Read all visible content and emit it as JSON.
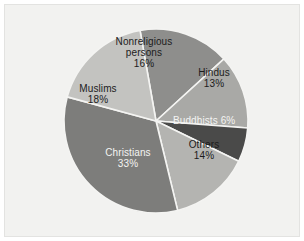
{
  "chart_data": {
    "type": "pie",
    "title": "",
    "subtitle": "",
    "xlabel": "",
    "ylabel": "",
    "legend_position": "none",
    "labels_position": "inside-slices",
    "grid": false,
    "total_percent": 100,
    "categories": [
      "Nonreligious persons",
      "Hindus",
      "Buddhists",
      "Others",
      "Christians",
      "Muslims"
    ],
    "values": [
      16,
      13,
      6,
      14,
      33,
      18
    ],
    "unit": "%",
    "slices": [
      {
        "name": "Nonreligious persons",
        "label_text": "Nonreligious\npersons\n16%",
        "value": 16,
        "value_text": "16%",
        "color": "#8e8e8c",
        "text_color": "#1c1c1c",
        "start_angle": -100,
        "sweep_angle": 57.6
      },
      {
        "name": "Hindus",
        "label_text": "Hindus\n13%",
        "value": 13,
        "value_text": "13%",
        "color": "#a9a9a6",
        "text_color": "#1c1c1c",
        "start_angle": -42.4,
        "sweep_angle": 46.8
      },
      {
        "name": "Buddhists",
        "label_text": "Buddhists 6%",
        "value": 6,
        "value_text": "6%",
        "color": "#4a4a49",
        "text_color": "#f4f4f2",
        "start_angle": 4.4,
        "sweep_angle": 21.6
      },
      {
        "name": "Others",
        "label_text": "Others\n14%",
        "value": 14,
        "value_text": "14%",
        "color": "#b4b4b1",
        "text_color": "#1c1c1c",
        "start_angle": 26,
        "sweep_angle": 50.4
      },
      {
        "name": "Christians",
        "label_text": "Christians\n33%",
        "value": 33,
        "value_text": "33%",
        "color": "#7d7d7b",
        "text_color": "#f4f4f2",
        "start_angle": 76.4,
        "sweep_angle": 118.8
      },
      {
        "name": "Muslims",
        "label_text": "Muslims\n18%",
        "value": 18,
        "value_text": "18%",
        "color": "#c3c3c0",
        "text_color": "#1c1c1c",
        "start_angle": 195.2,
        "sweep_angle": 64.8
      }
    ],
    "geometry": {
      "center_x": 151,
      "center_y": 116,
      "radius": 92,
      "divider_color": "#f4f4f2",
      "divider_width": 1.6
    },
    "colors": {
      "panel_background": "#f2f2f0",
      "panel_border": "#e3e3e1",
      "page_background": "#ffffff"
    }
  }
}
